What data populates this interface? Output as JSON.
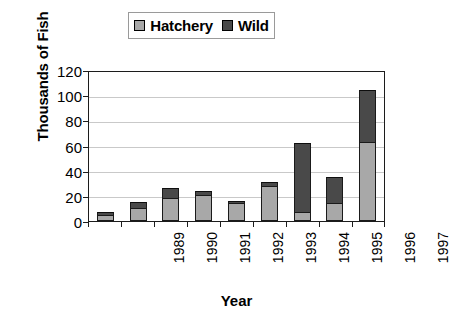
{
  "chart_data": {
    "type": "bar",
    "stacked": true,
    "title": "",
    "xlabel": "Year",
    "ylabel": "Thousands of Fish",
    "categories": [
      "1989",
      "1990",
      "1991",
      "1992",
      "1993",
      "1994",
      "1995",
      "1996",
      "1997"
    ],
    "series": [
      {
        "name": "Hatchery",
        "color": "#a8a8a8",
        "values": [
          5,
          10,
          18,
          21,
          14,
          28,
          7,
          14,
          63
        ]
      },
      {
        "name": "Wild",
        "color": "#494949",
        "values": [
          2,
          5,
          8,
          3,
          2,
          3,
          55,
          21,
          41
        ]
      }
    ],
    "totals": [
      7,
      15,
      26,
      24,
      16,
      31,
      62,
      35,
      104
    ],
    "ylim": [
      0,
      120
    ],
    "yticks": [
      0,
      20,
      40,
      60,
      80,
      100,
      120
    ],
    "ytick_labels": [
      "0",
      "20",
      "40",
      "60",
      "80",
      "100",
      "120"
    ],
    "grid": "horizontal",
    "legend_position": "top-center"
  },
  "legend": {
    "entries": [
      {
        "label": "Hatchery",
        "color": "#a8a8a8"
      },
      {
        "label": "Wild",
        "color": "#494949"
      }
    ]
  },
  "axes": {
    "y_title": "Thousands of Fish",
    "x_title": "Year"
  }
}
